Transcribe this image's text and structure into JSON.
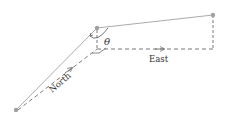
{
  "diagram": {
    "labels": {
      "angle": "θ",
      "east": "East",
      "north": "North"
    },
    "colors": {
      "solid_line": "#9a9a9a",
      "dashed_line": "#6a6a6a",
      "point": "#a0a0a0",
      "text": "#333333"
    },
    "points": {
      "start": [
        16,
        110
      ],
      "middle": [
        97,
        28
      ],
      "end": [
        213,
        15
      ],
      "corner": [
        97,
        48
      ],
      "right_corner": [
        213,
        49
      ]
    }
  }
}
